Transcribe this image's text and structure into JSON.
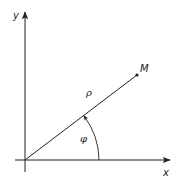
{
  "diagram": {
    "type": "polar-coordinates",
    "axes": {
      "x_label": "x",
      "y_label": "y"
    },
    "point": {
      "label": "M"
    },
    "radius_label": "ρ",
    "angle_label": "φ",
    "colors": {
      "line": "#222222",
      "background": "#ffffff"
    }
  }
}
